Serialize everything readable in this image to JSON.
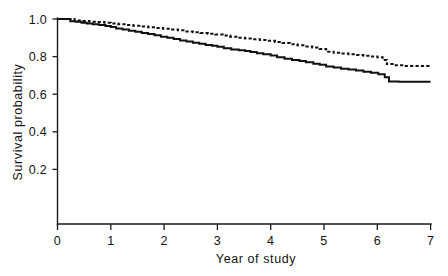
{
  "chart_data": {
    "type": "line",
    "title": "",
    "subtitle": "",
    "xlabel": "Year of study",
    "ylabel": "Survival probability",
    "xlim": [
      0,
      7
    ],
    "ylim": [
      0,
      1.0
    ],
    "grid": false,
    "legend": "none",
    "x_ticks": [
      0,
      1,
      2,
      3,
      4,
      5,
      6,
      7
    ],
    "x_tick_labels": [
      "0",
      "1",
      "2",
      "3",
      "4",
      "5",
      "6",
      "7"
    ],
    "y_ticks": [
      0.2,
      0.4,
      0.6,
      0.8,
      1.0
    ],
    "y_tick_labels": [
      "0.2",
      "0.4",
      "0.6",
      "0.8",
      "1.0"
    ],
    "curve_style": "kaplan-meier-step",
    "series": [
      {
        "name": "solid-curve",
        "style": "solid",
        "color": "#111111",
        "points": [
          [
            0.0,
            1.0
          ],
          [
            0.18,
            1.0
          ],
          [
            0.24,
            0.988
          ],
          [
            0.34,
            0.985
          ],
          [
            0.45,
            0.98
          ],
          [
            0.55,
            0.976
          ],
          [
            0.66,
            0.972
          ],
          [
            0.78,
            0.968
          ],
          [
            0.9,
            0.963
          ],
          [
            1.0,
            0.958
          ],
          [
            1.1,
            0.95
          ],
          [
            1.22,
            0.944
          ],
          [
            1.34,
            0.938
          ],
          [
            1.46,
            0.932
          ],
          [
            1.58,
            0.926
          ],
          [
            1.7,
            0.92
          ],
          [
            1.82,
            0.913
          ],
          [
            1.94,
            0.906
          ],
          [
            2.06,
            0.9
          ],
          [
            2.18,
            0.893
          ],
          [
            2.3,
            0.886
          ],
          [
            2.42,
            0.88
          ],
          [
            2.54,
            0.874
          ],
          [
            2.66,
            0.868
          ],
          [
            2.78,
            0.862
          ],
          [
            2.9,
            0.858
          ],
          [
            3.0,
            0.852
          ],
          [
            3.12,
            0.845
          ],
          [
            3.26,
            0.838
          ],
          [
            3.4,
            0.834
          ],
          [
            3.52,
            0.83
          ],
          [
            3.62,
            0.824
          ],
          [
            3.74,
            0.818
          ],
          [
            3.86,
            0.812
          ],
          [
            4.0,
            0.806
          ],
          [
            4.12,
            0.796
          ],
          [
            4.26,
            0.788
          ],
          [
            4.4,
            0.782
          ],
          [
            4.54,
            0.776
          ],
          [
            4.66,
            0.77
          ],
          [
            4.8,
            0.762
          ],
          [
            4.92,
            0.756
          ],
          [
            5.04,
            0.748
          ],
          [
            5.18,
            0.742
          ],
          [
            5.32,
            0.736
          ],
          [
            5.46,
            0.732
          ],
          [
            5.6,
            0.726
          ],
          [
            5.74,
            0.72
          ],
          [
            5.88,
            0.714
          ],
          [
            6.02,
            0.706
          ],
          [
            6.14,
            0.69
          ],
          [
            6.22,
            0.668
          ],
          [
            6.4,
            0.666
          ],
          [
            7.0,
            0.666
          ]
        ]
      },
      {
        "name": "dashed-curve",
        "style": "dashed",
        "color": "#111111",
        "points": [
          [
            0.0,
            1.0
          ],
          [
            0.22,
            1.0
          ],
          [
            0.32,
            0.992
          ],
          [
            0.46,
            0.99
          ],
          [
            0.6,
            0.986
          ],
          [
            0.74,
            0.984
          ],
          [
            0.88,
            0.98
          ],
          [
            1.0,
            0.976
          ],
          [
            1.14,
            0.972
          ],
          [
            1.28,
            0.968
          ],
          [
            1.42,
            0.964
          ],
          [
            1.56,
            0.96
          ],
          [
            1.7,
            0.956
          ],
          [
            1.84,
            0.952
          ],
          [
            1.98,
            0.948
          ],
          [
            2.12,
            0.944
          ],
          [
            2.26,
            0.94
          ],
          [
            2.4,
            0.934
          ],
          [
            2.54,
            0.93
          ],
          [
            2.68,
            0.926
          ],
          [
            2.82,
            0.922
          ],
          [
            2.96,
            0.918
          ],
          [
            3.1,
            0.912
          ],
          [
            3.24,
            0.906
          ],
          [
            3.38,
            0.9
          ],
          [
            3.52,
            0.896
          ],
          [
            3.66,
            0.892
          ],
          [
            3.8,
            0.888
          ],
          [
            3.94,
            0.884
          ],
          [
            4.08,
            0.878
          ],
          [
            4.22,
            0.872
          ],
          [
            4.36,
            0.866
          ],
          [
            4.5,
            0.86
          ],
          [
            4.64,
            0.854
          ],
          [
            4.78,
            0.848
          ],
          [
            4.92,
            0.84
          ],
          [
            5.04,
            0.826
          ],
          [
            5.18,
            0.82
          ],
          [
            5.32,
            0.816
          ],
          [
            5.46,
            0.812
          ],
          [
            5.6,
            0.808
          ],
          [
            5.74,
            0.804
          ],
          [
            5.88,
            0.8
          ],
          [
            6.0,
            0.796
          ],
          [
            6.1,
            0.782
          ],
          [
            6.18,
            0.76
          ],
          [
            6.32,
            0.754
          ],
          [
            6.5,
            0.75
          ],
          [
            7.0,
            0.75
          ]
        ]
      }
    ],
    "annotations": []
  },
  "figure": {
    "background_color": "#ffffff",
    "axis_color": "#1a1a1a"
  }
}
